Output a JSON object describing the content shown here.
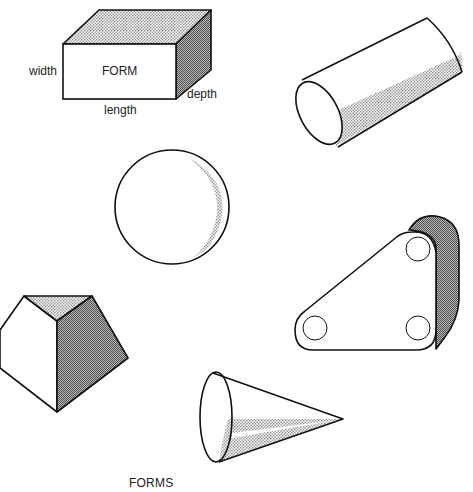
{
  "diagram": {
    "caption": "FORMS",
    "shapes": [
      {
        "name": "rectangular-prism",
        "face_label": "FORM",
        "dimension_labels": {
          "width": "width",
          "length": "length",
          "depth": "depth"
        }
      },
      {
        "name": "cylinder"
      },
      {
        "name": "sphere"
      },
      {
        "name": "triangular-plate-with-holes",
        "holes": 3
      },
      {
        "name": "truncated-pyramid"
      },
      {
        "name": "cone"
      }
    ],
    "colors": {
      "line": "#111111",
      "shade_light": "#c8c8c8",
      "shade_dark": "#8e8e8e",
      "background": "#ffffff"
    }
  }
}
